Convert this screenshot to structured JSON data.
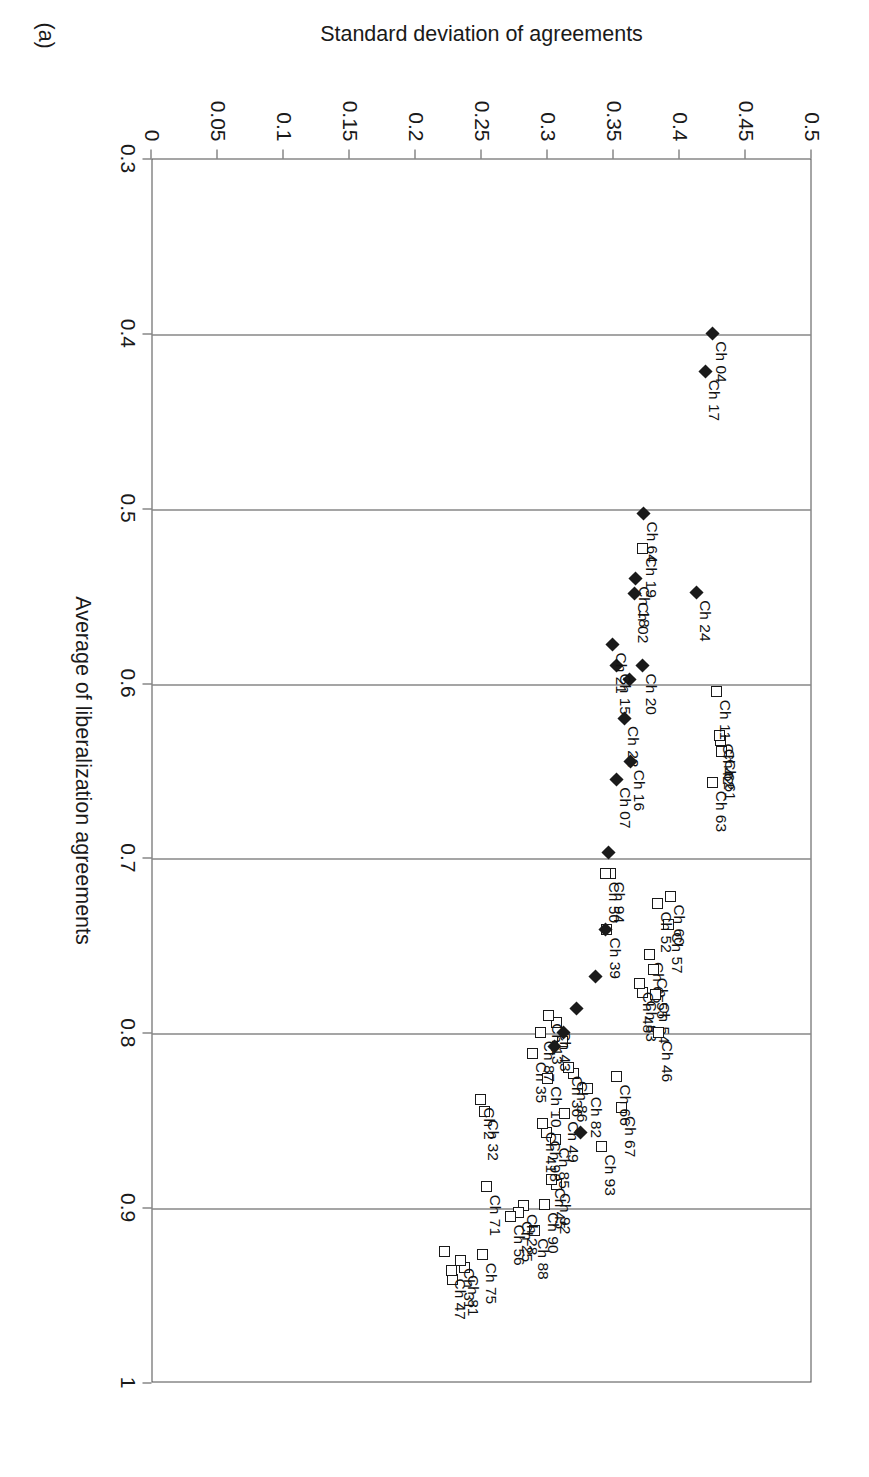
{
  "figure": {
    "panel_tag": "(a)",
    "xlabel": "Average of liberalization agreements",
    "ylabel": "Standard deviation of agreements"
  },
  "chart_data": {
    "type": "scatter",
    "title": "",
    "xlabel": "Average of liberalization agreements",
    "ylabel": "Standard deviation of agreements",
    "xlim": [
      0.3,
      1.0
    ],
    "ylim": [
      0,
      0.5
    ],
    "xticks": [
      "0.3",
      "0.4",
      "0.5",
      "0.6",
      "0.7",
      "0.8",
      "0.9",
      "1"
    ],
    "yticks": [
      "0",
      "0.05",
      "0.1",
      "0.15",
      "0.2",
      "0.25",
      "0.3",
      "0.35",
      "0.4",
      "0.45",
      "0.5"
    ],
    "grid": "vertical",
    "legend": "none",
    "series": [
      {
        "name": "open-square",
        "marker": "square-open",
        "points": [
          {
            "label": "Ch 60",
            "x": 0.722,
            "y": 0.393
          },
          {
            "label": "Ch 57",
            "x": 0.738,
            "y": 0.392
          },
          {
            "label": "Ch 52",
            "x": 0.726,
            "y": 0.383
          },
          {
            "label": "Ch 63",
            "x": 0.657,
            "y": 0.425
          },
          {
            "label": "Ch 61",
            "x": 0.639,
            "y": 0.432
          },
          {
            "label": "Ch 62",
            "x": 0.633,
            "y": 0.431
          },
          {
            "label": "Ch 42",
            "x": 0.63,
            "y": 0.43
          },
          {
            "label": "Ch 11",
            "x": 0.605,
            "y": 0.428
          },
          {
            "label": "Ch 19",
            "x": 0.523,
            "y": 0.372
          },
          {
            "label": "Ch 65",
            "x": 0.755,
            "y": 0.377
          },
          {
            "label": "Ch 55",
            "x": 0.764,
            "y": 0.38
          },
          {
            "label": "Ch 54",
            "x": 0.778,
            "y": 0.382
          },
          {
            "label": "Ch 83",
            "x": 0.777,
            "y": 0.372
          },
          {
            "label": "Ch 48",
            "x": 0.772,
            "y": 0.37
          },
          {
            "label": "Ch 46",
            "x": 0.8,
            "y": 0.384
          },
          {
            "label": "Ch 94",
            "x": 0.709,
            "y": 0.348
          },
          {
            "label": "Ch 39",
            "x": 0.741,
            "y": 0.345
          },
          {
            "label": "Ch 50",
            "x": 0.709,
            "y": 0.344
          },
          {
            "label": "Ch 67",
            "x": 0.843,
            "y": 0.356
          },
          {
            "label": "Ch 66",
            "x": 0.825,
            "y": 0.352
          },
          {
            "label": "Ch 93",
            "x": 0.865,
            "y": 0.341
          },
          {
            "label": "Ch 82",
            "x": 0.832,
            "y": 0.33
          },
          {
            "label": "Ch 86",
            "x": 0.823,
            "y": 0.32
          },
          {
            "label": "Ch 36",
            "x": 0.82,
            "y": 0.316
          },
          {
            "label": "Ch 92",
            "x": 0.887,
            "y": 0.307
          },
          {
            "label": "Ch 45",
            "x": 0.884,
            "y": 0.303
          },
          {
            "label": "Ch 90",
            "x": 0.898,
            "y": 0.298
          },
          {
            "label": "Ch 88",
            "x": 0.913,
            "y": 0.29
          },
          {
            "label": "Ch 28",
            "x": 0.899,
            "y": 0.282
          },
          {
            "label": "Ch 25",
            "x": 0.903,
            "y": 0.278
          },
          {
            "label": "Ch 56",
            "x": 0.905,
            "y": 0.272
          },
          {
            "label": "Ch 71",
            "x": 0.888,
            "y": 0.254
          },
          {
            "label": "Ch 75",
            "x": 0.927,
            "y": 0.251
          },
          {
            "label": "Ch 81",
            "x": 0.934,
            "y": 0.237
          },
          {
            "label": "Ch 31",
            "x": 0.93,
            "y": 0.234
          },
          {
            "label": "Ch 46b",
            "x": 0.941,
            "y": 0.228
          },
          {
            "label": "Ch 47",
            "x": 0.936,
            "y": 0.227
          },
          {
            "label": "Ch 25b",
            "x": 0.925,
            "y": 0.222
          },
          {
            "label": "Ch 32",
            "x": 0.845,
            "y": 0.252
          },
          {
            "label": "Ch 2",
            "x": 0.838,
            "y": 0.249
          },
          {
            "label": "Ch 35",
            "x": 0.812,
            "y": 0.289
          },
          {
            "label": "Ch 10",
            "x": 0.826,
            "y": 0.3
          },
          {
            "label": "Ch 49",
            "x": 0.846,
            "y": 0.313
          },
          {
            "label": "Ch 85",
            "x": 0.861,
            "y": 0.306
          },
          {
            "label": "Ch 98",
            "x": 0.857,
            "y": 0.299
          },
          {
            "label": "Ch 41",
            "x": 0.852,
            "y": 0.296
          },
          {
            "label": "Ch 18b",
            "x": 0.805,
            "y": 0.311
          },
          {
            "label": "Ch 43",
            "x": 0.794,
            "y": 0.307
          },
          {
            "label": "Ch 13",
            "x": 0.79,
            "y": 0.301
          },
          {
            "label": "Ch 87",
            "x": 0.8,
            "y": 0.295
          }
        ]
      },
      {
        "name": "filled-diamond",
        "marker": "diamond-filled",
        "points": [
          {
            "label": "Ch 04",
            "x": 0.4,
            "y": 0.425
          },
          {
            "label": "Ch 17",
            "x": 0.422,
            "y": 0.42
          },
          {
            "label": "Ch 64",
            "x": 0.503,
            "y": 0.373
          },
          {
            "label": "Ch 18",
            "x": 0.54,
            "y": 0.367
          },
          {
            "label": "Ch 02",
            "x": 0.549,
            "y": 0.366
          },
          {
            "label": "Ch 24",
            "x": 0.548,
            "y": 0.413
          },
          {
            "label": "Ch 20",
            "x": 0.59,
            "y": 0.372
          },
          {
            "label": "Ch 10d",
            "x": 0.598,
            "y": 0.362
          },
          {
            "label": "Ch 15",
            "x": 0.59,
            "y": 0.352
          },
          {
            "label": "Ch 21",
            "x": 0.578,
            "y": 0.349
          },
          {
            "label": "Ch 22",
            "x": 0.62,
            "y": 0.358
          },
          {
            "label": "Ch 16",
            "x": 0.645,
            "y": 0.363
          },
          {
            "label": "Ch 07",
            "x": 0.655,
            "y": 0.352
          },
          {
            "label": "Ch 94d",
            "x": 0.697,
            "y": 0.346
          },
          {
            "label": "Ch 39d",
            "x": 0.741,
            "y": 0.344
          },
          {
            "label": "Ch 45d",
            "x": 0.768,
            "y": 0.336
          },
          {
            "label": "Ch 12d",
            "x": 0.786,
            "y": 0.322
          },
          {
            "label": "Ch 33d",
            "x": 0.8,
            "y": 0.312
          },
          {
            "label": "Ch 51d",
            "x": 0.808,
            "y": 0.305
          },
          {
            "label": "Ch 73d",
            "x": 0.857,
            "y": 0.325
          }
        ]
      }
    ]
  },
  "labels_visible": [
    "Ch 60",
    "Ch 57",
    "Ch 52",
    "Ch 63",
    "Ch 61",
    "Ch 62",
    "Ch 42",
    "Ch 11",
    "Ch 19",
    "Ch 18",
    "Ch 02",
    "Ch 64",
    "Ch 24",
    "Ch 04",
    "Ch 17",
    "Ch 20",
    "Ch 10",
    "Ch 15",
    "Ch 21",
    "Ch 22",
    "Ch 16",
    "Ch 07",
    "Ch 65",
    "Ch 55",
    "Ch 54",
    "Ch 83",
    "Ch 48",
    "Ch 46",
    "Ch 94",
    "Ch 39",
    "Ch 50",
    "Ch 67",
    "Ch 66",
    "Ch 93",
    "Ch 82",
    "Ch 86",
    "Ch 36",
    "Ch 92",
    "Ch 45",
    "Ch 90",
    "Ch 88",
    "Ch 28",
    "Ch 25",
    "Ch 56",
    "Ch 71",
    "Ch 75",
    "Ch 81",
    "Ch 31",
    "Ch 47",
    "Ch 32",
    "Ch 2",
    "Ch 35",
    "Ch 49",
    "Ch 85",
    "Ch 98",
    "Ch 41",
    "Ch 43",
    "Ch 13",
    "Ch 87",
    "Ch 33"
  ]
}
